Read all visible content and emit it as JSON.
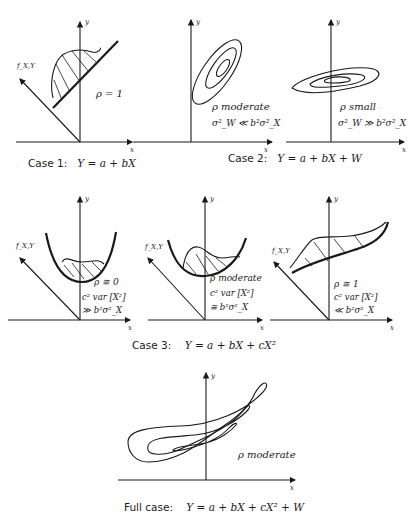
{
  "figure": {
    "panels": [
      {
        "id": "case1",
        "axes": {
          "x": "x",
          "y": "y",
          "f": "f_X,Y"
        },
        "annotation": "ρ = 1",
        "description": "Regression line with density ridge along it"
      },
      {
        "id": "case2a",
        "axes": {
          "x": "x",
          "y": "y"
        },
        "annotation": "ρ moderate",
        "condition": "σ²_W ≪ b²σ²_X",
        "description": "Elongated elliptical contours tilted steeply"
      },
      {
        "id": "case2b",
        "axes": {
          "x": "x",
          "y": "y"
        },
        "annotation": "ρ small",
        "condition": "σ²_W ≫ b²σ²_X",
        "description": "Wide flat elliptical contours"
      },
      {
        "id": "case3a",
        "axes": {
          "x": "x",
          "y": "y",
          "f": "f_X,Y"
        },
        "annotation": "ρ ≅ 0",
        "condition_line1": "c² var [X²]",
        "condition_line2": "≫ b²σ²_X"
      },
      {
        "id": "case3b",
        "axes": {
          "x": "x",
          "y": "y",
          "f": "f_X,Y"
        },
        "annotation": "ρ moderate",
        "condition_line1": "c² var [X²]",
        "condition_line2": "≅ b²σ²_X"
      },
      {
        "id": "case3c",
        "axes": {
          "x": "x",
          "y": "y",
          "f": "f_X,Y"
        },
        "annotation": "ρ ≅ 1",
        "condition_line1": "c² var [X²]",
        "condition_line2": "≪ b²σ²_X"
      },
      {
        "id": "full",
        "axes": {
          "x": "x",
          "y": "y"
        },
        "annotation": "ρ moderate",
        "description": "Banana-shaped nested contours"
      }
    ],
    "captions": {
      "case1": {
        "label": "Case 1:",
        "equation": "Y = a + bX"
      },
      "case2": {
        "label": "Case 2:",
        "equation": "Y = a + bX + W"
      },
      "case3": {
        "label": "Case 3:",
        "equation": "Y = a + bX + cX²"
      },
      "full": {
        "label": "Full case:",
        "equation": "Y = a + bX + cX² + W"
      }
    },
    "line_color": "#1a1a1a",
    "background": "#ffffff"
  }
}
